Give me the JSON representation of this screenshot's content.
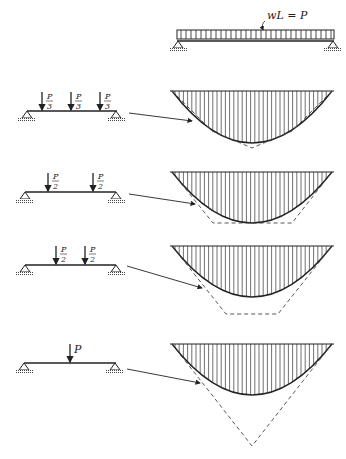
{
  "figure": {
    "top_load_label": "wL = P",
    "panels": [
      {
        "id": "three-loads",
        "loads": [
          "P/3",
          "P/3",
          "P/3"
        ],
        "load_num": "P",
        "load_den": "3"
      },
      {
        "id": "two-loads-wide",
        "loads": [
          "P/2",
          "P/2"
        ],
        "load_num": "P",
        "load_den": "2"
      },
      {
        "id": "two-loads-close",
        "loads": [
          "P/2",
          "P/2"
        ],
        "load_num": "P",
        "load_den": "2"
      },
      {
        "id": "single-load",
        "loads": [
          "P"
        ],
        "load_label": "P"
      }
    ]
  },
  "colors": {
    "line": "#222222",
    "hatch": "#333333",
    "background": "#ffffff"
  }
}
